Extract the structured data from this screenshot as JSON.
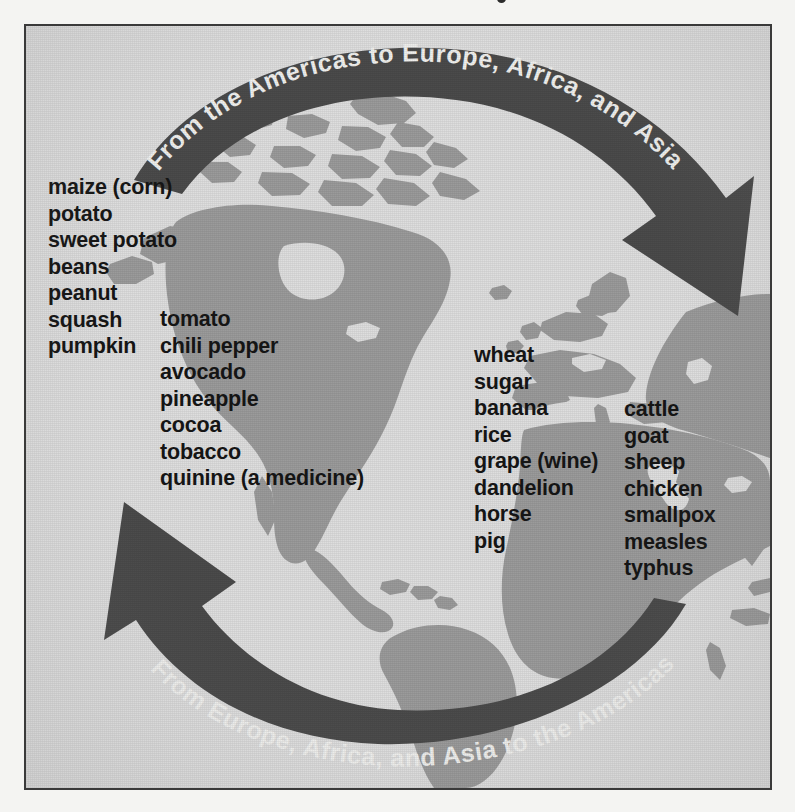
{
  "diagram": {
    "type": "cycle-diagram",
    "background_color": "#dedede",
    "land_color": "#9b9b9b",
    "arrow_color": "#4b4b4b",
    "border_color": "#3a3a3a",
    "text_color": "#161616",
    "arrow_text_color": "#f0f0ee"
  },
  "arrows": [
    {
      "id": "top-arrow",
      "label": "From the Americas to Europe, Africa, and Asia",
      "direction": "left-to-right",
      "curve": "arc-over-top"
    },
    {
      "id": "bottom-arrow",
      "label": "From Europe, Africa, and Asia to the Americas",
      "direction": "right-to-left",
      "curve": "arc-under-bottom"
    }
  ],
  "columns": [
    {
      "id": "americas-column-1",
      "origin": "Americas",
      "items": [
        "maize (corn)",
        "potato",
        "sweet potato",
        "beans",
        "peanut",
        "squash",
        "pumpkin"
      ]
    },
    {
      "id": "americas-column-2",
      "origin": "Americas",
      "items": [
        "tomato",
        "chili pepper",
        "avocado",
        "pineapple",
        "cocoa",
        "tobacco",
        "quinine (a medicine)"
      ]
    },
    {
      "id": "oldworld-column-1",
      "origin": "Europe, Africa, and Asia",
      "items": [
        "wheat",
        "sugar",
        "banana",
        "rice",
        "grape (wine)",
        "dandelion",
        "horse",
        "pig"
      ]
    },
    {
      "id": "oldworld-column-2",
      "origin": "Europe, Africa, and Asia",
      "items": [
        "cattle",
        "goat",
        "sheep",
        "chicken",
        "smallpox",
        "measles",
        "typhus"
      ]
    }
  ]
}
